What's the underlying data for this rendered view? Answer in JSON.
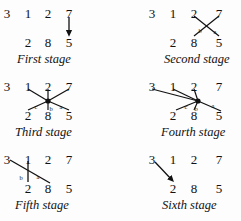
{
  "figure": {
    "background_color": "#fdfdfd",
    "ink_color": "#111111",
    "top_row_values": [
      "3",
      "1",
      "2",
      "7"
    ],
    "bottom_row_values": [
      "2",
      "8",
      "5"
    ]
  },
  "panels": [
    {
      "id": "first-stage",
      "caption": "First stage",
      "top": [
        "3",
        "1",
        "2",
        "7"
      ],
      "bottom": [
        "2",
        "8",
        "5"
      ],
      "edge_labels": [],
      "edges": [
        {
          "name": "edge-7-to-5",
          "from": "7",
          "to": "5",
          "arrow": "down"
        }
      ]
    },
    {
      "id": "second-stage",
      "caption": "Second stage",
      "top": [
        "3",
        "1",
        "2",
        "7"
      ],
      "bottom": [
        "2",
        "8",
        "5"
      ],
      "edge_labels": [
        "b",
        "a"
      ],
      "edges": [
        {
          "name": "edge-2-to-5",
          "from": "2",
          "to": "5",
          "arrow": "none"
        },
        {
          "name": "edge-7-to-8",
          "from": "7",
          "to": "8",
          "arrow": "none"
        }
      ]
    },
    {
      "id": "third-stage",
      "caption": "Third stage",
      "top": [
        "3",
        "1",
        "2",
        "7"
      ],
      "bottom": [
        "2",
        "8",
        "5"
      ],
      "edge_labels": [
        "c",
        "b",
        "a"
      ],
      "edges": [
        {
          "name": "edge-1-to-node",
          "from": "1",
          "to": "node",
          "arrow": "none"
        },
        {
          "name": "edge-2top-to-node",
          "from": "2",
          "to": "node",
          "arrow": "none"
        },
        {
          "name": "edge-7-to-node",
          "from": "7",
          "to": "node",
          "arrow": "none"
        },
        {
          "name": "edge-node-to-2bottom",
          "from": "node",
          "to": "2",
          "arrow": "none"
        },
        {
          "name": "edge-node-to-8",
          "from": "node",
          "to": "8",
          "arrow": "none"
        },
        {
          "name": "edge-node-to-5",
          "from": "node",
          "to": "5",
          "arrow": "none"
        }
      ]
    },
    {
      "id": "fourth-stage",
      "caption": "Fourth stage",
      "top": [
        "3",
        "1",
        "2",
        "7"
      ],
      "bottom": [
        "2",
        "8",
        "5"
      ],
      "edge_labels": [
        "c",
        "b",
        "a"
      ],
      "edges": [
        {
          "name": "edge-3-to-node",
          "from": "3",
          "to": "node",
          "arrow": "none"
        },
        {
          "name": "edge-1-to-node",
          "from": "1",
          "to": "node",
          "arrow": "none"
        },
        {
          "name": "edge-2top-to-node",
          "from": "2",
          "to": "node",
          "arrow": "none"
        },
        {
          "name": "edge-node-to-2bottom",
          "from": "node",
          "to": "2",
          "arrow": "none"
        },
        {
          "name": "edge-node-to-8",
          "from": "node",
          "to": "8",
          "arrow": "none"
        },
        {
          "name": "edge-node-to-5",
          "from": "node",
          "to": "5",
          "arrow": "none"
        }
      ]
    },
    {
      "id": "fifth-stage",
      "caption": "Fifth stage",
      "top": [
        "3",
        "1",
        "2",
        "7"
      ],
      "bottom": [
        "2",
        "8",
        "5"
      ],
      "edge_labels": [
        "b",
        "a"
      ],
      "edges": [
        {
          "name": "edge-3-to-8",
          "from": "3",
          "to": "8",
          "arrow": "none"
        },
        {
          "name": "edge-1-to-2",
          "from": "1",
          "to": "2",
          "arrow": "none"
        }
      ]
    },
    {
      "id": "sixth-stage",
      "caption": "Sixth stage",
      "top": [
        "3",
        "1",
        "2",
        "7"
      ],
      "bottom": [
        "2",
        "8",
        "5"
      ],
      "edge_labels": [],
      "edges": [
        {
          "name": "edge-3-to-2",
          "from": "3",
          "to": "2",
          "arrow": "down-right"
        }
      ]
    }
  ]
}
